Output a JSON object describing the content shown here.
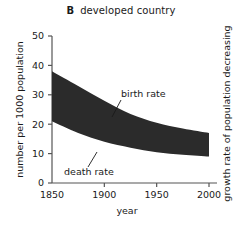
{
  "chart_data": {
    "type": "area",
    "title": "developed country",
    "panel_letter": "B",
    "xlabel": "year",
    "ylabel": "number per 1000 population",
    "right_label": "growth rate of population decreasing",
    "xlim": [
      1850,
      2000
    ],
    "ylim": [
      0,
      50
    ],
    "xticks": [
      1850,
      1900,
      1950,
      2000
    ],
    "xtick_labels": [
      "1850",
      "1900",
      "1950",
      "2000"
    ],
    "yticks": [
      0,
      10,
      20,
      30,
      40,
      50
    ],
    "ytick_labels": [
      "0",
      "10",
      "20",
      "30",
      "40",
      "50"
    ],
    "grid": false,
    "legend": "none",
    "band_fill_color": "#2b2b2b",
    "x": [
      1850,
      1875,
      1900,
      1925,
      1950,
      1975,
      2000
    ],
    "series": [
      {
        "name": "birth rate",
        "values": [
          38,
          33,
          28,
          23.5,
          20.5,
          18.5,
          17
        ]
      },
      {
        "name": "death rate",
        "values": [
          21,
          17,
          14,
          12,
          10.5,
          9.6,
          9
        ]
      }
    ],
    "annotations": [
      {
        "name": "birth rate",
        "label": "birth rate",
        "text_x": 121,
        "text_y": 97,
        "leader_from_x": 121,
        "leader_from_y": 100,
        "leader_to_x": 112,
        "leader_to_y": 117
      },
      {
        "name": "death rate",
        "label": "death rate",
        "text_x": 64,
        "text_y": 175,
        "leader_from_x": 88,
        "leader_from_y": 167,
        "leader_to_x": 97,
        "leader_to_y": 152
      }
    ]
  },
  "axis": {
    "x_tick_px": [
      52,
      101.67,
      151.33,
      201
    ],
    "y_tick_px": [
      183,
      153.6,
      124.2,
      94.8,
      65.4,
      36
    ],
    "origin_x_px": 52,
    "baseline_y_px": 183,
    "right_px": 209,
    "top_y_px": 36
  }
}
